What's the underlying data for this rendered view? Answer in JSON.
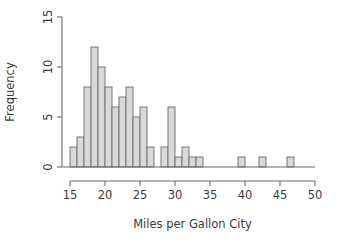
{
  "chart_data": {
    "type": "bar",
    "title": "",
    "subtitle": "",
    "xlabel": "Miles per Gallon City",
    "ylabel": "Frequency",
    "xlim": [
      15,
      50
    ],
    "ylim": [
      0,
      15
    ],
    "xticks": [
      15,
      20,
      25,
      30,
      35,
      40,
      45,
      50
    ],
    "xtick_labels": [
      "15",
      "20",
      "25",
      "30",
      "35",
      "40",
      "45",
      "50"
    ],
    "yticks": [
      0,
      5,
      10,
      15
    ],
    "ytick_labels": [
      "0",
      "5",
      "10",
      "15"
    ],
    "grid": false,
    "legend": null,
    "bin_width": 1,
    "bin_edges": [
      15,
      16,
      17,
      18,
      19,
      20,
      21,
      22,
      23,
      24,
      25,
      26,
      27,
      28,
      29,
      30,
      31,
      32,
      33,
      34,
      35,
      36,
      37,
      38,
      39,
      40,
      41,
      42,
      43,
      44,
      45,
      46,
      47
    ],
    "categories": [
      "15-16",
      "16-17",
      "17-18",
      "18-19",
      "19-20",
      "20-21",
      "21-22",
      "22-23",
      "23-24",
      "24-25",
      "25-26",
      "26-27",
      "27-28",
      "28-29",
      "29-30",
      "30-31",
      "31-32",
      "32-33",
      "33-34",
      "34-35",
      "35-36",
      "36-37",
      "37-38",
      "38-39",
      "39-40",
      "40-41",
      "41-42",
      "42-43",
      "43-44",
      "44-45",
      "45-46",
      "46-47"
    ],
    "values": [
      2,
      3,
      8,
      12,
      10,
      8,
      6,
      7,
      8,
      5,
      6,
      2,
      0,
      2,
      6,
      1,
      2,
      1,
      1,
      0,
      0,
      0,
      0,
      0,
      1,
      0,
      0,
      1,
      0,
      0,
      0,
      1
    ],
    "bars": [
      {
        "x0": 15,
        "x1": 16,
        "height": 2
      },
      {
        "x0": 16,
        "x1": 17,
        "height": 3
      },
      {
        "x0": 17,
        "x1": 18,
        "height": 8
      },
      {
        "x0": 18,
        "x1": 19,
        "height": 12
      },
      {
        "x0": 19,
        "x1": 20,
        "height": 10
      },
      {
        "x0": 20,
        "x1": 21,
        "height": 8
      },
      {
        "x0": 21,
        "x1": 22,
        "height": 6
      },
      {
        "x0": 22,
        "x1": 23,
        "height": 7
      },
      {
        "x0": 23,
        "x1": 24,
        "height": 8
      },
      {
        "x0": 24,
        "x1": 25,
        "height": 5
      },
      {
        "x0": 25,
        "x1": 26,
        "height": 6
      },
      {
        "x0": 26,
        "x1": 27,
        "height": 2
      },
      {
        "x0": 27,
        "x1": 28,
        "height": 0
      },
      {
        "x0": 28,
        "x1": 29,
        "height": 2
      },
      {
        "x0": 29,
        "x1": 30,
        "height": 6
      },
      {
        "x0": 30,
        "x1": 31,
        "height": 1
      },
      {
        "x0": 31,
        "x1": 32,
        "height": 2
      },
      {
        "x0": 32,
        "x1": 33,
        "height": 1
      },
      {
        "x0": 33,
        "x1": 34,
        "height": 1
      },
      {
        "x0": 34,
        "x1": 35,
        "height": 0
      },
      {
        "x0": 35,
        "x1": 36,
        "height": 0
      },
      {
        "x0": 36,
        "x1": 37,
        "height": 0
      },
      {
        "x0": 37,
        "x1": 38,
        "height": 0
      },
      {
        "x0": 38,
        "x1": 39,
        "height": 0
      },
      {
        "x0": 39,
        "x1": 40,
        "height": 1
      },
      {
        "x0": 40,
        "x1": 41,
        "height": 0
      },
      {
        "x0": 41,
        "x1": 42,
        "height": 0
      },
      {
        "x0": 42,
        "x1": 43,
        "height": 1
      },
      {
        "x0": 43,
        "x1": 44,
        "height": 0
      },
      {
        "x0": 44,
        "x1": 45,
        "height": 0
      },
      {
        "x0": 45,
        "x1": 46,
        "height": 0
      },
      {
        "x0": 46,
        "x1": 47,
        "height": 1
      }
    ],
    "colors": {
      "bar_fill": "#d9d9d9",
      "bar_stroke": "#6b6b6b",
      "axis": "#6b6b6b",
      "text": "#3b3b3b",
      "background": "#ffffff"
    }
  }
}
